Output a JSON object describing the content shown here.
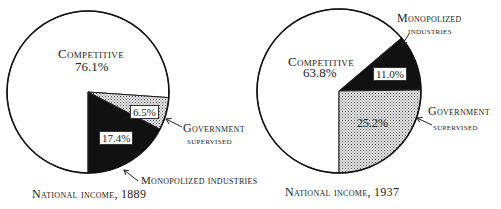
{
  "chart_data": [
    {
      "type": "pie",
      "title": "National income, 1889",
      "categories": [
        "Competitive",
        "Government supervised",
        "Monopolized industries"
      ],
      "values": [
        76.1,
        6.5,
        17.4
      ],
      "value_labels": [
        "76.1%",
        "6.5%",
        "17.4%"
      ],
      "fills": [
        "white",
        "dotted-gray",
        "black"
      ]
    },
    {
      "type": "pie",
      "title": "National income, 1937",
      "categories": [
        "Competitive",
        "Monopolized industries",
        "Government supervised"
      ],
      "values": [
        63.8,
        11.0,
        25.2
      ],
      "value_labels": [
        "63.8%",
        "11.0%",
        "25.2%"
      ],
      "fills": [
        "white",
        "black",
        "dotted-gray"
      ]
    }
  ],
  "left": {
    "competitive_label": "Competitive",
    "competitive_value": "76.1%",
    "gov_value": "6.5%",
    "mono_value": "17.4%",
    "gov_label_1": "Government",
    "gov_label_2": "supervised",
    "mono_label": "Monopolized industries",
    "caption": "National income, 1889"
  },
  "right": {
    "competitive_label": "Competitive",
    "competitive_value": "63.8%",
    "mono_value": "11.0%",
    "gov_value": "25.2%",
    "mono_label_1": "Monopolized",
    "mono_label_2": "industries",
    "gov_label_1": "Government",
    "gov_label_2": "supervised",
    "caption": "National income, 1937"
  }
}
